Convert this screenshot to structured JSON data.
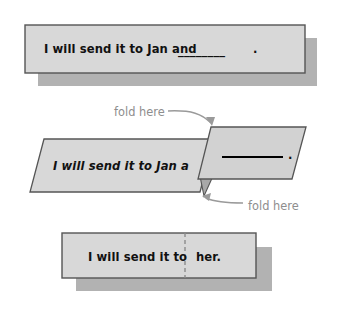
{
  "figure": {
    "title_visible": false,
    "background_color": "#ffffff",
    "card_fill": "#d8d8d8",
    "card_border": "#555555",
    "shadow_fill": "#b2b2b2",
    "flap_fill": "#d2d2d2",
    "tuck_fill": "#a8a8a8",
    "annotation_color": "#8e8e8e",
    "text_color": "#111111",
    "dashed_line_color": "#8c8c8c",
    "blank_line_color": "#000000"
  },
  "steps": [
    {
      "id": "step-1-unfolded",
      "sentence_before_blank": "I will send it to Jan and",
      "blank": "________",
      "punctuation": ".",
      "full_text": "I will send it to Jan and ________ ."
    },
    {
      "id": "step-2-folding",
      "left_panel_text": "I will send it to Jan a",
      "right_flap_blank": "__________",
      "right_flap_punctuation": ".",
      "annotations": [
        {
          "label": "fold here",
          "position": "top-left",
          "arrow": "curve-right-down"
        },
        {
          "label": "fold here",
          "position": "bottom-right",
          "arrow": "curve-left-up"
        }
      ]
    },
    {
      "id": "step-3-folded",
      "left_text": "I will send it to",
      "right_text": "her.",
      "fold_crease": "dashed-vertical"
    }
  ]
}
